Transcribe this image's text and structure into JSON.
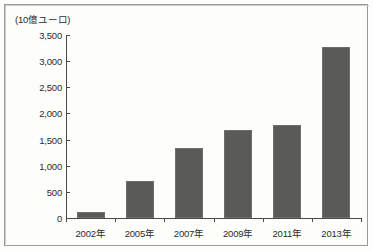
{
  "chart_data": {
    "type": "bar",
    "title": "",
    "unit_label": "(10億ユーロ)",
    "xlabel": "",
    "ylabel": "",
    "categories": [
      "2002年",
      "2005年",
      "2007年",
      "2009年",
      "2011年",
      "2013年"
    ],
    "values": [
      120,
      710,
      1340,
      1680,
      1780,
      3270
    ],
    "series": [
      {
        "name": "",
        "values": [
          120,
          710,
          1340,
          1680,
          1780,
          3270
        ]
      }
    ],
    "ylim": [
      0,
      3500
    ],
    "ytick_values": [
      0,
      500,
      1000,
      1500,
      2000,
      2500,
      3000,
      3500
    ],
    "ytick_labels": [
      "0",
      "500",
      "1,000",
      "1,500",
      "2,000",
      "2,500",
      "3,000",
      "3,500"
    ],
    "grid": false,
    "legend": null,
    "legend_position": "none",
    "bar_color": "#5a5a58",
    "axis_color": "#4a4a48",
    "text_color": "#2b2b2b",
    "background_color": "#fdfdfb",
    "frame_color": "#9a9a96"
  }
}
